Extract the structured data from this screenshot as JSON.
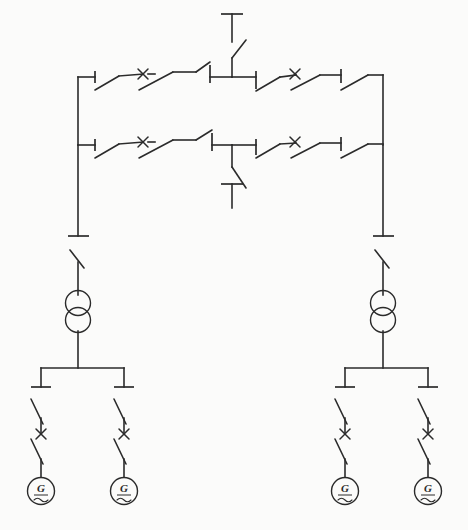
{
  "diagram": {
    "subtitle": "Double busbar substation with two transformers and four generators",
    "type": "single-line-diagram",
    "canvas": {
      "width": 468,
      "height": 530
    },
    "background_color": "#fbfbfa",
    "line_color": "#2b2b2b"
  },
  "symbols": {
    "disconnect_switch": "open knife disconnect switch",
    "circuit_breaker": "x-marked circuit breaker",
    "transformer": "two-winding transformer (overlapping circles)",
    "generator": "generator (circle with G and sine wave)",
    "terminal": "line terminal bar"
  },
  "buses": {
    "top_bus": {
      "name": "Bus I (upper busbar)",
      "y": 77,
      "x_start": 78,
      "x_end": 383
    },
    "lower_bus": {
      "name": "Bus II (lower busbar)",
      "y": 145,
      "x_start": 78,
      "x_end": 383
    },
    "left_riser": {
      "name": "Left bus riser",
      "x": 78
    },
    "right_riser": {
      "name": "Right bus riser",
      "x": 383
    }
  },
  "feeders": [
    {
      "id": "feeder-top",
      "name": "Incoming feeder (upper)",
      "label": "",
      "direction": "up",
      "x": 232,
      "terminal_y": 14,
      "bus": "top_bus"
    },
    {
      "id": "feeder-bottom",
      "name": "Outgoing feeder (lower)",
      "label": "",
      "direction": "down",
      "x": 232,
      "terminal_y": 208,
      "bus": "lower_bus"
    }
  ],
  "bay_groups": [
    {
      "id": "bay-top-left",
      "name": "Upper bus left bay",
      "bus": "top_bus",
      "devices": [
        "disconnect_switch",
        "circuit_breaker",
        "disconnect_switch"
      ]
    },
    {
      "id": "bay-top-right",
      "name": "Upper bus right bay",
      "bus": "top_bus",
      "devices": [
        "disconnect_switch",
        "circuit_breaker",
        "disconnect_switch"
      ]
    },
    {
      "id": "bay-lower-left",
      "name": "Lower bus left bay",
      "bus": "lower_bus",
      "devices": [
        "disconnect_switch",
        "circuit_breaker",
        "disconnect_switch"
      ]
    },
    {
      "id": "bay-lower-right",
      "name": "Lower bus right bay",
      "bus": "lower_bus",
      "devices": [
        "disconnect_switch",
        "circuit_breaker",
        "disconnect_switch"
      ]
    }
  ],
  "transformers": [
    {
      "id": "transformer-left",
      "name": "Step-down transformer T1",
      "label": "",
      "x": 78,
      "y": 310,
      "windings": 2
    },
    {
      "id": "transformer-right",
      "name": "Step-down transformer T2",
      "label": "",
      "x": 383,
      "y": 310,
      "windings": 2
    }
  ],
  "generators": [
    {
      "id": "generator-1",
      "name": "Generator G1",
      "label": "G",
      "x": 41,
      "y": 491
    },
    {
      "id": "generator-2",
      "name": "Generator G2",
      "label": "G",
      "x": 124,
      "y": 491
    },
    {
      "id": "generator-3",
      "name": "Generator G3",
      "label": "G",
      "x": 345,
      "y": 491
    },
    {
      "id": "generator-4",
      "name": "Generator G4",
      "label": "G",
      "x": 428,
      "y": 491
    }
  ],
  "generator_buses": [
    {
      "id": "gen-bus-left",
      "name": "Left generator busbar",
      "y": 368,
      "x_start": 41,
      "x_end": 124
    },
    {
      "id": "gen-bus-right",
      "name": "Right generator busbar",
      "y": 368,
      "x_start": 345,
      "x_end": 428
    }
  ]
}
